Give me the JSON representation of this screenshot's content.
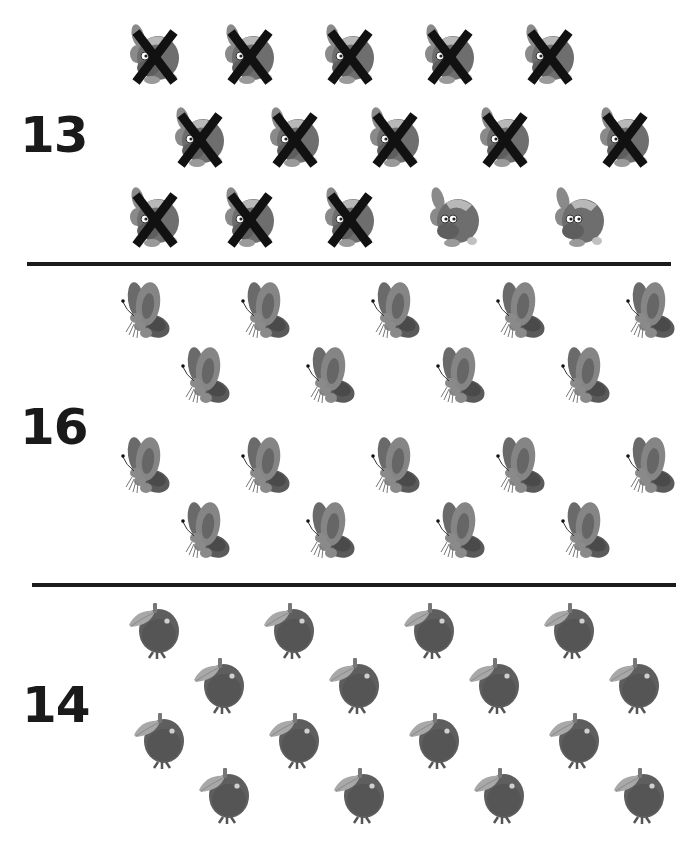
{
  "worksheet": {
    "sections": [
      {
        "label": "13",
        "item_type": "fish",
        "icon": "fish-icon",
        "total_items": 15,
        "crossed_out": 13,
        "rows": [
          {
            "y": 55,
            "items": [
              {
                "x": 155,
                "crossed": true
              },
              {
                "x": 250,
                "crossed": true
              },
              {
                "x": 350,
                "crossed": true
              },
              {
                "x": 450,
                "crossed": true
              },
              {
                "x": 550,
                "crossed": true
              }
            ]
          },
          {
            "y": 138,
            "items": [
              {
                "x": 200,
                "crossed": true
              },
              {
                "x": 295,
                "crossed": true
              },
              {
                "x": 395,
                "crossed": true
              },
              {
                "x": 505,
                "crossed": true
              },
              {
                "x": 625,
                "crossed": true
              }
            ]
          },
          {
            "y": 218,
            "items": [
              {
                "x": 155,
                "crossed": true
              },
              {
                "x": 250,
                "crossed": true
              },
              {
                "x": 350,
                "crossed": true
              },
              {
                "x": 455,
                "crossed": false
              },
              {
                "x": 580,
                "crossed": false
              }
            ]
          }
        ]
      },
      {
        "label": "16",
        "item_type": "butterfly",
        "icon": "butterfly-icon",
        "total_items": 18,
        "rows": [
          {
            "y": 310,
            "items": [
              {
                "x": 145
              },
              {
                "x": 265
              },
              {
                "x": 395
              },
              {
                "x": 520
              },
              {
                "x": 650
              }
            ]
          },
          {
            "y": 375,
            "items": [
              {
                "x": 205
              },
              {
                "x": 330
              },
              {
                "x": 460
              },
              {
                "x": 585
              }
            ]
          },
          {
            "y": 465,
            "items": [
              {
                "x": 145
              },
              {
                "x": 265
              },
              {
                "x": 395
              },
              {
                "x": 520
              },
              {
                "x": 650
              }
            ]
          },
          {
            "y": 530,
            "items": [
              {
                "x": 205
              },
              {
                "x": 330
              },
              {
                "x": 460
              },
              {
                "x": 585
              }
            ]
          }
        ]
      },
      {
        "label": "14",
        "item_type": "apple",
        "icon": "apple-icon",
        "total_items": 16,
        "rows": [
          {
            "y": 630,
            "items": [
              {
                "x": 155
              },
              {
                "x": 290
              },
              {
                "x": 430
              },
              {
                "x": 570
              }
            ]
          },
          {
            "y": 685,
            "items": [
              {
                "x": 220
              },
              {
                "x": 355
              },
              {
                "x": 495
              },
              {
                "x": 635
              }
            ]
          },
          {
            "y": 740,
            "items": [
              {
                "x": 160
              },
              {
                "x": 295
              },
              {
                "x": 435
              },
              {
                "x": 575
              }
            ]
          },
          {
            "y": 795,
            "items": [
              {
                "x": 225
              },
              {
                "x": 360
              },
              {
                "x": 500
              },
              {
                "x": 640
              }
            ]
          }
        ]
      }
    ],
    "dividers": [
      {
        "x1": 27,
        "x2": 671,
        "y": 263
      },
      {
        "x1": 32,
        "x2": 676,
        "y": 584
      }
    ],
    "labels_pos": [
      {
        "x": 20,
        "y": 120
      },
      {
        "x": 20,
        "y": 410
      },
      {
        "x": 22,
        "y": 688
      }
    ],
    "colors": {
      "ink": "#1a1a1a",
      "divider": "#1c1c1c",
      "cross": "#111111",
      "fish_body": "#6e6e6e",
      "butterfly_wing": "#777777",
      "apple_body": "#5e5e5e"
    }
  }
}
